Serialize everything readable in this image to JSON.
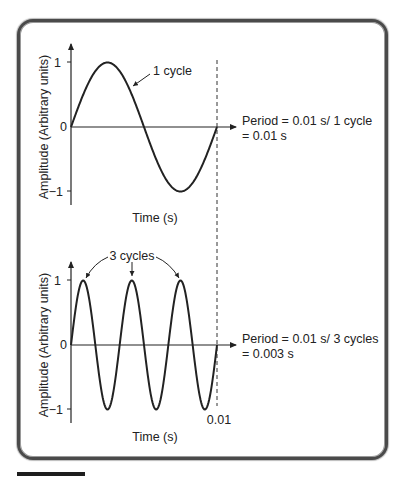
{
  "colors": {
    "ink": "#222222",
    "frame": "#4a4a4a",
    "background": "#ffffff"
  },
  "top_panel": {
    "y_axis_label": "Amplitude (Arbitrary units)",
    "x_axis_label": "Time (s)",
    "ticks": {
      "plus_one": "1",
      "zero": "0",
      "minus_one": "−1"
    },
    "annotation": "1 cycle",
    "period_line1": "Period = 0.01 s/ 1 cycle",
    "period_line2": "= 0.01 s"
  },
  "bottom_panel": {
    "y_axis_label": "Amplitude (Arbitrary units)",
    "x_axis_label": "Time (s)",
    "ticks": {
      "plus_one": "1",
      "zero": "0",
      "minus_one": "−1"
    },
    "x_tick": "0.01",
    "annotation": "3 cycles",
    "period_line1": "Period = 0.01 s/ 3 cycles",
    "period_line2": "= 0.003 s"
  },
  "chart_data": [
    {
      "type": "line",
      "title": "",
      "xlabel": "Time (s)",
      "ylabel": "Amplitude (Arbitrary units)",
      "x_range": [
        0,
        0.01
      ],
      "ylim": [
        -1,
        1
      ],
      "series": [
        {
          "name": "sine, 1 cycle",
          "function": "sin(2*pi*100*t)",
          "cycles": 1,
          "frequency_hz": 100
        }
      ],
      "annotations": [
        "1 cycle",
        "Period = 0.01 s/ 1 cycle = 0.01 s"
      ],
      "grid": false
    },
    {
      "type": "line",
      "title": "",
      "xlabel": "Time (s)",
      "ylabel": "Amplitude (Arbitrary units)",
      "x_range": [
        0,
        0.01
      ],
      "x_ticks": [
        "0.01"
      ],
      "ylim": [
        -1,
        1
      ],
      "series": [
        {
          "name": "sine, 3 cycles",
          "function": "sin(2*pi*300*t)",
          "cycles": 3,
          "frequency_hz": 300
        }
      ],
      "annotations": [
        "3 cycles",
        "Period = 0.01 s/ 3 cycles = 0.003 s"
      ],
      "grid": false
    }
  ]
}
